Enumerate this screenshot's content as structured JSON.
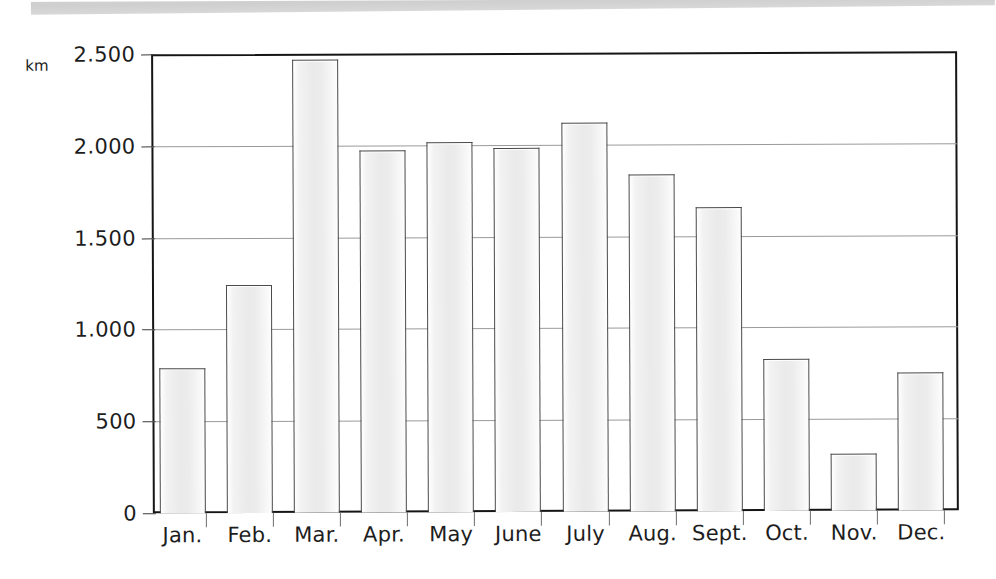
{
  "page": {
    "background_color": "#ffffff",
    "scan_band_color": "#d2d2d2"
  },
  "chart_data": {
    "type": "bar",
    "title": "",
    "subtitle": "",
    "xlabel": "",
    "ylabel": "km",
    "unit_label": "km",
    "categories": [
      "Jan.",
      "Feb.",
      "Mar.",
      "Apr.",
      "May",
      "June",
      "July",
      "Aug.",
      "Sept.",
      "Oct.",
      "Nov.",
      "Dec."
    ],
    "values": [
      790,
      1240,
      2470,
      1970,
      2015,
      1985,
      2120,
      1835,
      1655,
      830,
      310,
      750
    ],
    "ylim": [
      0,
      2500
    ],
    "ytick_values": [
      0,
      500,
      1000,
      1500,
      2000,
      2500
    ],
    "ytick_labels": [
      "0",
      "500",
      "1.000",
      "1.500",
      "2.000",
      "2.500"
    ],
    "grid": true,
    "grid_axis": "y",
    "legend": false,
    "legend_position": "none",
    "bar_fill_color": "#eeeeee",
    "bar_edge_color": "#4a4a4a",
    "gridline_color": "#9a9a9a",
    "frame_color": "#151515",
    "text_color": "#1d1d1d"
  }
}
